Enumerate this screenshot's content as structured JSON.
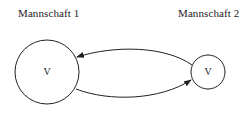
{
  "diagram": {
    "type": "state-transition",
    "nodes": [
      {
        "id": "team1",
        "title": "Mannschaft 1",
        "symbol": "V",
        "size": "large"
      },
      {
        "id": "team2",
        "title": "Mannschaft 2",
        "symbol": "V",
        "size": "small"
      }
    ],
    "edges": [
      {
        "from": "team2",
        "to": "team1",
        "position": "top"
      },
      {
        "from": "team1",
        "to": "team2",
        "position": "bottom"
      }
    ],
    "colors": {
      "stroke": "#222222",
      "background": "#ffffff"
    }
  }
}
